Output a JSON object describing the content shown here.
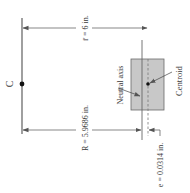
{
  "diagram": {
    "center_label": "C",
    "r_bar_label": "r̄ = 6 in.",
    "R_label": "R = 5.9686 in.",
    "e_label": "e = 0.0314 in.",
    "neutral_axis_label": "Neutral axis",
    "centroid_label": "Centroid",
    "colors": {
      "line": "#555555",
      "section_fill": "#c8c8c8",
      "section_stroke": "#6a6a6a",
      "text": "#3a3a3a"
    }
  }
}
